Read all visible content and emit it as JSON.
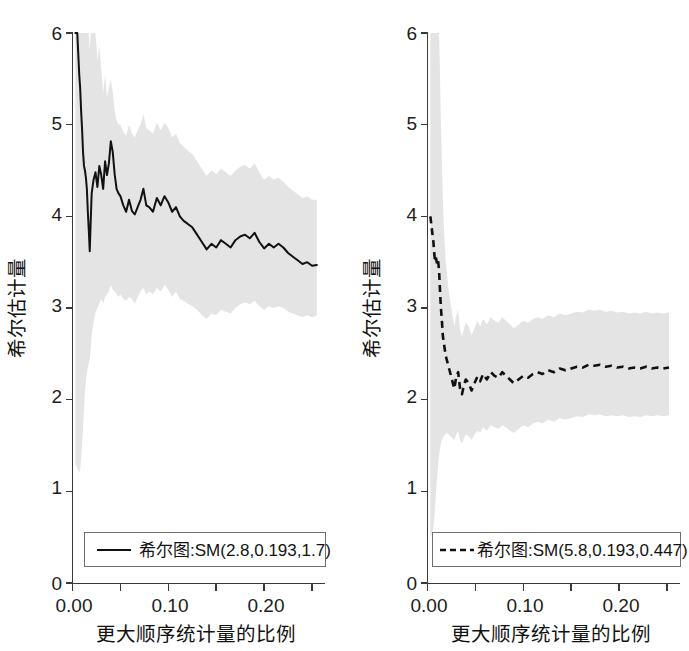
{
  "chart_data": [
    {
      "type": "line",
      "panel": "left",
      "title": "",
      "xlabel": "更大顺序统计量的比例",
      "ylabel": "希尔估计量",
      "xlim": [
        0.0,
        0.26
      ],
      "ylim": [
        0,
        6.3
      ],
      "grid": false,
      "xticks": [
        0.0,
        0.05,
        0.1,
        0.15,
        0.2,
        0.25
      ],
      "xticklabels": [
        "0.00",
        "",
        "0.10",
        "",
        "0.20",
        ""
      ],
      "yticks": [
        0,
        1,
        2,
        3,
        4,
        5,
        6
      ],
      "yticklabels": [
        "0",
        "1",
        "2",
        "3",
        "4",
        "5",
        "6"
      ],
      "legend": {
        "position": "lower center",
        "entries": [
          {
            "label": "希尔图:SM(2.8,0.193,1.7)",
            "linestyle": "solid",
            "color": "#111111"
          }
        ]
      },
      "series": [
        {
          "name": "希尔图:SM(2.8,0.193,1.7)",
          "linestyle": "solid",
          "x": [
            0.003,
            0.005,
            0.007,
            0.008,
            0.009,
            0.01,
            0.011,
            0.012,
            0.013,
            0.014,
            0.015,
            0.016,
            0.017,
            0.018,
            0.019,
            0.02,
            0.022,
            0.024,
            0.026,
            0.028,
            0.03,
            0.032,
            0.034,
            0.036,
            0.038,
            0.04,
            0.042,
            0.044,
            0.046,
            0.048,
            0.05,
            0.053,
            0.056,
            0.059,
            0.062,
            0.065,
            0.068,
            0.071,
            0.074,
            0.077,
            0.08,
            0.084,
            0.088,
            0.092,
            0.096,
            0.1,
            0.104,
            0.108,
            0.112,
            0.116,
            0.12,
            0.125,
            0.13,
            0.135,
            0.14,
            0.145,
            0.15,
            0.155,
            0.16,
            0.165,
            0.17,
            0.175,
            0.18,
            0.185,
            0.19,
            0.195,
            0.2,
            0.205,
            0.21,
            0.215,
            0.22,
            0.225,
            0.23,
            0.235,
            0.24,
            0.245,
            0.25,
            0.255
          ],
          "y": [
            6.3,
            6.1,
            5.55,
            5.4,
            5.15,
            4.95,
            4.7,
            4.55,
            4.5,
            4.42,
            4.3,
            4.05,
            3.85,
            3.62,
            3.95,
            4.25,
            4.4,
            4.48,
            4.32,
            4.55,
            4.45,
            4.3,
            4.6,
            4.45,
            4.58,
            4.82,
            4.7,
            4.46,
            4.3,
            4.25,
            4.22,
            4.12,
            4.05,
            4.18,
            4.06,
            4.02,
            4.1,
            4.18,
            4.3,
            4.12,
            4.1,
            4.05,
            4.2,
            4.12,
            4.22,
            4.15,
            4.05,
            4.1,
            4.0,
            3.95,
            3.92,
            3.88,
            3.8,
            3.72,
            3.64,
            3.7,
            3.66,
            3.74,
            3.7,
            3.66,
            3.74,
            3.78,
            3.8,
            3.76,
            3.82,
            3.72,
            3.65,
            3.7,
            3.66,
            3.7,
            3.66,
            3.6,
            3.56,
            3.52,
            3.48,
            3.5,
            3.46,
            3.47
          ],
          "band_lower": [
            1.3,
            1.25,
            1.2,
            1.25,
            1.35,
            1.5,
            1.7,
            1.9,
            2.1,
            2.2,
            2.3,
            2.35,
            2.4,
            2.45,
            2.55,
            2.7,
            2.85,
            2.95,
            3.0,
            3.05,
            3.1,
            3.05,
            3.12,
            3.15,
            3.18,
            3.25,
            3.2,
            3.18,
            3.15,
            3.12,
            3.15,
            3.1,
            3.08,
            3.12,
            3.1,
            3.05,
            3.12,
            3.18,
            3.22,
            3.15,
            3.18,
            3.15,
            3.22,
            3.18,
            3.25,
            3.2,
            3.12,
            3.18,
            3.1,
            3.08,
            3.05,
            3.02,
            2.98,
            2.92,
            2.88,
            2.94,
            2.92,
            2.98,
            2.96,
            2.94,
            3.0,
            3.04,
            3.06,
            3.04,
            3.08,
            3.02,
            2.98,
            3.02,
            3.0,
            3.02,
            3.0,
            2.96,
            2.94,
            2.92,
            2.9,
            2.92,
            2.9,
            2.92
          ],
          "band_upper": [
            6.3,
            6.3,
            6.3,
            6.3,
            6.3,
            6.3,
            6.3,
            6.3,
            6.3,
            6.3,
            6.3,
            6.25,
            6.1,
            5.8,
            6.2,
            6.3,
            6.28,
            6.1,
            5.7,
            5.85,
            5.6,
            5.35,
            5.55,
            5.3,
            5.4,
            5.5,
            5.35,
            5.15,
            5.05,
            5.0,
            5.0,
            4.92,
            4.88,
            5.0,
            4.9,
            4.86,
            4.94,
            5.0,
            5.12,
            4.96,
            4.94,
            4.9,
            5.02,
            4.94,
            5.02,
            4.96,
            4.86,
            4.9,
            4.8,
            4.76,
            4.72,
            4.68,
            4.6,
            4.52,
            4.44,
            4.5,
            4.46,
            4.52,
            4.48,
            4.44,
            4.5,
            4.54,
            4.56,
            4.52,
            4.58,
            4.48,
            4.4,
            4.44,
            4.4,
            4.42,
            4.38,
            4.32,
            4.28,
            4.24,
            4.2,
            4.22,
            4.18,
            4.18
          ]
        }
      ]
    },
    {
      "type": "line",
      "panel": "right",
      "title": "",
      "xlabel": "更大顺序统计量的比例",
      "ylabel": "希尔估计量",
      "xlim": [
        0.0,
        0.26
      ],
      "ylim": [
        0,
        6.3
      ],
      "grid": false,
      "xticks": [
        0.0,
        0.05,
        0.1,
        0.15,
        0.2,
        0.25
      ],
      "xticklabels": [
        "0.00",
        "",
        "0.10",
        "",
        "0.20",
        ""
      ],
      "yticks": [
        0,
        1,
        2,
        3,
        4,
        5,
        6
      ],
      "yticklabels": [
        "0",
        "1",
        "2",
        "3",
        "4",
        "5",
        "6"
      ],
      "legend": {
        "position": "lower center",
        "entries": [
          {
            "label": "希尔图:SM(5.8,0.193,0.447)",
            "linestyle": "dashed",
            "color": "#111111"
          }
        ]
      },
      "series": [
        {
          "name": "希尔图:SM(5.8,0.193,0.447)",
          "linestyle": "dashed",
          "x": [
            0.003,
            0.005,
            0.006,
            0.007,
            0.008,
            0.009,
            0.01,
            0.011,
            0.012,
            0.013,
            0.014,
            0.015,
            0.016,
            0.017,
            0.018,
            0.019,
            0.02,
            0.022,
            0.024,
            0.026,
            0.028,
            0.03,
            0.032,
            0.034,
            0.036,
            0.038,
            0.04,
            0.043,
            0.046,
            0.049,
            0.052,
            0.055,
            0.058,
            0.062,
            0.066,
            0.07,
            0.074,
            0.078,
            0.082,
            0.086,
            0.09,
            0.095,
            0.1,
            0.105,
            0.11,
            0.115,
            0.12,
            0.126,
            0.132,
            0.138,
            0.144,
            0.15,
            0.156,
            0.162,
            0.168,
            0.174,
            0.18,
            0.186,
            0.192,
            0.198,
            0.204,
            0.21,
            0.216,
            0.222,
            0.228,
            0.234,
            0.24,
            0.246,
            0.252
          ],
          "y": [
            4.0,
            3.82,
            3.74,
            3.6,
            3.5,
            3.54,
            3.48,
            3.52,
            3.42,
            3.2,
            3.0,
            2.86,
            2.7,
            2.62,
            2.55,
            2.48,
            2.44,
            2.36,
            2.28,
            2.2,
            2.12,
            2.25,
            2.3,
            2.12,
            2.06,
            2.16,
            2.22,
            2.18,
            2.1,
            2.18,
            2.25,
            2.2,
            2.28,
            2.22,
            2.3,
            2.26,
            2.24,
            2.3,
            2.26,
            2.22,
            2.18,
            2.22,
            2.26,
            2.24,
            2.28,
            2.3,
            2.28,
            2.32,
            2.3,
            2.34,
            2.32,
            2.34,
            2.36,
            2.35,
            2.38,
            2.37,
            2.38,
            2.36,
            2.37,
            2.35,
            2.36,
            2.34,
            2.35,
            2.34,
            2.36,
            2.34,
            2.35,
            2.34,
            2.35
          ],
          "band_lower": [
            0.5,
            0.55,
            0.6,
            0.7,
            0.85,
            1.0,
            1.15,
            1.28,
            1.38,
            1.46,
            1.52,
            1.56,
            1.58,
            1.6,
            1.62,
            1.62,
            1.64,
            1.62,
            1.6,
            1.58,
            1.56,
            1.62,
            1.66,
            1.56,
            1.52,
            1.58,
            1.62,
            1.6,
            1.56,
            1.62,
            1.66,
            1.64,
            1.7,
            1.66,
            1.72,
            1.7,
            1.68,
            1.72,
            1.7,
            1.66,
            1.64,
            1.68,
            1.72,
            1.7,
            1.74,
            1.76,
            1.74,
            1.78,
            1.76,
            1.8,
            1.78,
            1.8,
            1.82,
            1.81,
            1.84,
            1.83,
            1.84,
            1.82,
            1.83,
            1.82,
            1.83,
            1.81,
            1.82,
            1.81,
            1.83,
            1.82,
            1.83,
            1.82,
            1.83
          ],
          "band_upper": [
            6.3,
            6.3,
            6.3,
            6.3,
            6.3,
            6.3,
            6.3,
            6.3,
            6.2,
            5.6,
            5.0,
            4.6,
            4.2,
            3.9,
            3.7,
            3.5,
            3.4,
            3.2,
            3.06,
            2.92,
            2.8,
            2.92,
            2.98,
            2.76,
            2.68,
            2.78,
            2.84,
            2.8,
            2.7,
            2.78,
            2.86,
            2.8,
            2.88,
            2.82,
            2.9,
            2.86,
            2.84,
            2.9,
            2.86,
            2.82,
            2.78,
            2.82,
            2.86,
            2.84,
            2.88,
            2.9,
            2.88,
            2.92,
            2.9,
            2.94,
            2.92,
            2.94,
            2.96,
            2.95,
            2.98,
            2.97,
            2.98,
            2.96,
            2.97,
            2.95,
            2.96,
            2.94,
            2.95,
            2.94,
            2.96,
            2.94,
            2.95,
            2.94,
            2.95
          ]
        }
      ]
    }
  ],
  "panels": {
    "left": {
      "ylabel": "希尔估计量",
      "xlabel": "更大顺序统计量的比例",
      "legend_label": "希尔图:SM(2.8,0.193,1.7)",
      "xticklabels": [
        "0.00",
        "0.10",
        "0.20"
      ],
      "yticklabels": [
        "0",
        "1",
        "2",
        "3",
        "4",
        "5",
        "6"
      ]
    },
    "right": {
      "ylabel": "希尔估计量",
      "xlabel": "更大顺序统计量的比例",
      "legend_label": "希尔图:SM(5.8,0.193,0.447)",
      "xticklabels": [
        "0.00",
        "0.10",
        "0.20"
      ],
      "yticklabels": [
        "0",
        "1",
        "2",
        "3",
        "4",
        "5",
        "6"
      ]
    }
  },
  "colors": {
    "band": "#e4e4e4",
    "line": "#111111",
    "axis": "#3a3a3a",
    "background": "#ffffff"
  }
}
